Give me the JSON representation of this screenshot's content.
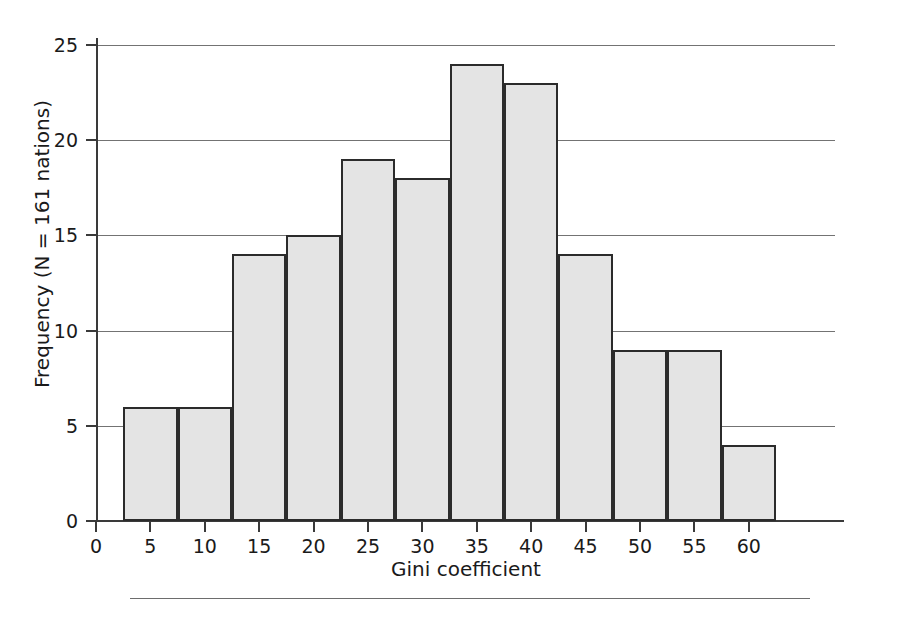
{
  "chart_data": {
    "type": "bar",
    "title": "",
    "subtitle": "",
    "xlabel": "Gini coefficient",
    "ylabel": "Frequency (N = 161 nations)",
    "categories": [
      "5",
      "10",
      "15",
      "20",
      "25",
      "30",
      "35",
      "40",
      "45",
      "50",
      "55",
      "60"
    ],
    "values": [
      6,
      6,
      14,
      15,
      19,
      18,
      24,
      23,
      14,
      9,
      9,
      4
    ],
    "series": [
      {
        "name": "Frequency",
        "values": [
          6,
          6,
          14,
          15,
          19,
          18,
          24,
          23,
          14,
          9,
          9,
          4
        ]
      }
    ],
    "xlim": [
      0,
      62.5
    ],
    "ylim": [
      0,
      25
    ],
    "xticks": [
      0,
      5,
      10,
      15,
      20,
      25,
      30,
      35,
      40,
      45,
      50,
      55,
      60
    ],
    "xtick_labels": [
      "0",
      "5",
      "10",
      "15",
      "20",
      "25",
      "30",
      "35",
      "40",
      "45",
      "50",
      "55",
      "60"
    ],
    "yticks": [
      0,
      5,
      10,
      15,
      20,
      25
    ],
    "ytick_labels": [
      "0",
      "5",
      "10",
      "15",
      "20",
      "25"
    ],
    "grid": "horizontal",
    "legend": "none",
    "bin_width": 5,
    "bar_fill_color": "#e4e4e4",
    "bar_edge_color": "#2b2b2b",
    "gridline_color": "#5a5a5a",
    "axis_color": "#3a3a3a",
    "background_color": "#ffffff",
    "annotations": []
  },
  "figure": {
    "caption_rule_present": true
  }
}
